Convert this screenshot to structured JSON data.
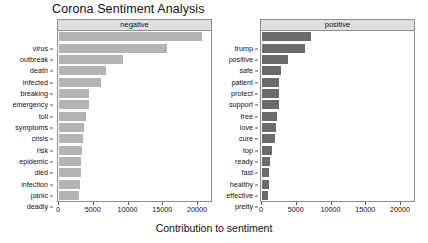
{
  "chart_data": {
    "type": "bar",
    "title": "Corona Sentiment Analysis",
    "xlabel": "Contribution to sentiment",
    "ylabel": "",
    "orientation": "horizontal",
    "grid": false,
    "legend": false,
    "xlim": [
      0,
      22000
    ],
    "xticks": [
      0,
      5000,
      10000,
      15000,
      20000
    ],
    "xticklabels": [
      "0",
      "5000",
      "10000",
      "15000",
      "20000"
    ],
    "panels": [
      {
        "name": "negative",
        "facet_label": "negative",
        "bar_color": "#b4b4b4",
        "categories": [
          "virus",
          "outbreak",
          "death",
          "infected",
          "breaking",
          "emergency",
          "toll",
          "symptoms",
          "crisis",
          "risk",
          "epidemic",
          "died",
          "infection",
          "panic",
          "deadly"
        ],
        "values": [
          20600,
          15600,
          9200,
          6700,
          6000,
          4300,
          4250,
          3900,
          3600,
          3450,
          3350,
          3200,
          3150,
          3050,
          2900
        ]
      },
      {
        "name": "positive",
        "facet_label": "positive",
        "bar_color": "#6b6b6b",
        "categories": [
          "trump",
          "positive",
          "safe",
          "patient",
          "protect",
          "support",
          "free",
          "love",
          "cure",
          "top",
          "ready",
          "fast",
          "healthy",
          "effective",
          "pretty"
        ],
        "values": [
          7000,
          6150,
          3700,
          2700,
          2450,
          2430,
          2420,
          2150,
          2000,
          1850,
          1430,
          1150,
          1050,
          1000,
          880
        ]
      }
    ]
  }
}
